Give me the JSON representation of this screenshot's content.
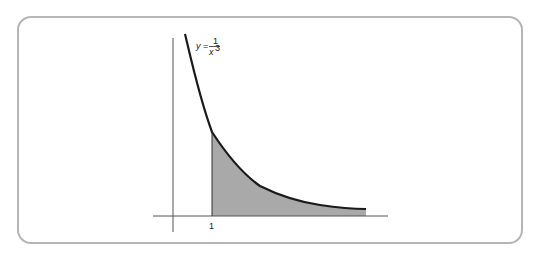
{
  "figure": {
    "function_label": {
      "lhs": "y",
      "eq": "=",
      "numerator": "1",
      "denominator_base": "x",
      "denominator_exp": "3"
    },
    "x_tick_label": "1",
    "colors": {
      "curve": "#1a1a1a",
      "fill": "#a9a9a9",
      "axes": "#555555",
      "frame": "#b5b5b5"
    }
  }
}
